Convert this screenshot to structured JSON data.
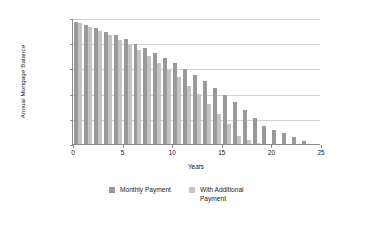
{
  "chart_data": {
    "type": "bar",
    "title": "",
    "subtitle": "",
    "xlabel": "Years",
    "ylabel": "Annual Mortgage Balance",
    "xlim": [
      0,
      25
    ],
    "ylim": [
      0,
      250000
    ],
    "xticks": [
      0,
      5,
      10,
      15,
      20,
      25
    ],
    "xtick_labels": [
      "0",
      "5",
      "10",
      "15",
      "20",
      "25"
    ],
    "yticks": [
      0,
      50000,
      100000,
      150000,
      200000,
      250000
    ],
    "ytick_labels": [
      "$0",
      "$50,000",
      "$100,000",
      "$150,000",
      "$200,000",
      "$250,000"
    ],
    "grid": true,
    "grid_axis": "y",
    "legend_position": "bottom",
    "categories": [
      1,
      2,
      3,
      4,
      5,
      6,
      7,
      8,
      9,
      10,
      11,
      12,
      13,
      14,
      15,
      16,
      17,
      18,
      19,
      20,
      21,
      22,
      23,
      24
    ],
    "series": [
      {
        "name": "Monthly Payment",
        "color": "#999999",
        "values": [
          243000,
          237000,
          230000,
          223000,
          216000,
          208000,
          199000,
          190000,
          181000,
          171000,
          160000,
          149000,
          137000,
          125000,
          112000,
          98000,
          83000,
          68000,
          51000,
          35000,
          28000,
          21000,
          13000,
          5000
        ]
      },
      {
        "name": "With Additional Payment",
        "color": "#c4c4c4",
        "values": [
          240000,
          233000,
          225000,
          216000,
          207000,
          197000,
          186000,
          174000,
          161000,
          147000,
          132000,
          116000,
          99000,
          80000,
          60000,
          39000,
          16000,
          8000,
          3000,
          0,
          0,
          0,
          0,
          0
        ]
      }
    ],
    "legend": [
      {
        "label": "Monthly Payment",
        "color": "#999999"
      },
      {
        "label": "With Additional Payment",
        "color": "#c4c4c4"
      }
    ]
  }
}
